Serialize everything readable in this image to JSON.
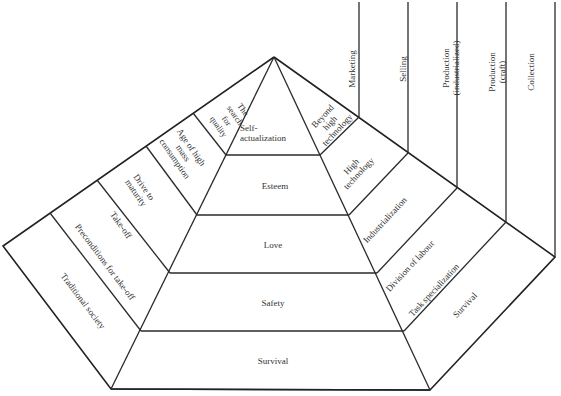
{
  "diagram": {
    "title": "",
    "center_levels": [
      {
        "label": "Self-\nactualization"
      },
      {
        "label": "Esteem"
      },
      {
        "label": "Love"
      },
      {
        "label": "Safety"
      },
      {
        "label": "Survival"
      }
    ],
    "left_stages": [
      {
        "label": "The\nsearch\nfor\nquality"
      },
      {
        "label": "Age of high\nmass\nconsumption"
      },
      {
        "label": "Drive to\nmaturity"
      },
      {
        "label": "Take-off"
      },
      {
        "label": "Preconditions for take-off"
      },
      {
        "label": "Traditional society"
      }
    ],
    "right_stages": [
      {
        "label": "Beyond\nhigh\ntechnology"
      },
      {
        "label": "High\ntechnology"
      },
      {
        "label": "Industrialization"
      },
      {
        "label": "Division of labour"
      },
      {
        "label": "Task specialization"
      },
      {
        "label": "Survival"
      }
    ],
    "columns": [
      {
        "label": "Marketing"
      },
      {
        "label": "Selling"
      },
      {
        "label": "Production\n(industrialized)"
      },
      {
        "label": "Production\n(craft)"
      },
      {
        "label": "Collection"
      }
    ],
    "colors": {
      "line": "#2a2a2a",
      "text": "#333333",
      "background": "#ffffff"
    }
  }
}
